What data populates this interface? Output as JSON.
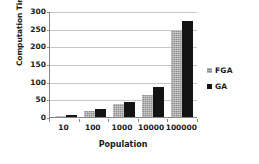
{
  "chart_data": {
    "type": "bar",
    "title": "",
    "xlabel": "Population",
    "ylabel": "Computation Time",
    "categories": [
      "10",
      "100",
      "1000",
      "10000",
      "100000"
    ],
    "series": [
      {
        "name": "FGA",
        "color": "#8f8f8f",
        "values": [
          4,
          17,
          36,
          63,
          246
        ]
      },
      {
        "name": "GA",
        "color": "#141414",
        "values": [
          7,
          24,
          43,
          86,
          273
        ]
      }
    ],
    "ylim": [
      0,
      300
    ],
    "yticks": [
      0,
      50,
      100,
      150,
      200,
      250,
      300
    ],
    "ytick_labels": [
      "0",
      "50",
      "100",
      "150",
      "200",
      "250",
      "300"
    ],
    "grid": true,
    "legend_position": "right",
    "axis_color": "#868686",
    "grid_color": "#c7c7c7",
    "background": "#ffffff"
  }
}
